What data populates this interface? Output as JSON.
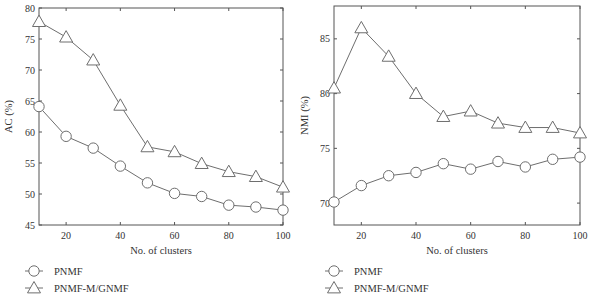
{
  "chart_data": [
    {
      "type": "line",
      "title": "",
      "xlabel": "No. of clusters",
      "ylabel": "AC (%)",
      "x": [
        10,
        20,
        30,
        40,
        50,
        60,
        70,
        80,
        90,
        100
      ],
      "xlim": [
        10,
        100
      ],
      "ylim": [
        45,
        80
      ],
      "xticks": [
        20,
        40,
        60,
        80,
        100
      ],
      "yticks": [
        45,
        50,
        55,
        60,
        65,
        70,
        75,
        80
      ],
      "grid": false,
      "legend_position": "below-left",
      "series": [
        {
          "name": "PNMF",
          "marker": "circle",
          "values": [
            64.1,
            59.3,
            57.4,
            54.5,
            51.8,
            50.1,
            49.6,
            48.2,
            47.9,
            47.4
          ]
        },
        {
          "name": "PNMF-M/GNMF",
          "marker": "triangle",
          "values": [
            77.8,
            75.3,
            71.6,
            64.3,
            57.6,
            56.8,
            54.9,
            53.6,
            52.8,
            51.1
          ]
        }
      ]
    },
    {
      "type": "line",
      "title": "",
      "xlabel": "No. of clusters",
      "ylabel": "NMI (%)",
      "x": [
        10,
        20,
        30,
        40,
        50,
        60,
        70,
        80,
        90,
        100
      ],
      "xlim": [
        10,
        100
      ],
      "ylim": [
        68,
        88
      ],
      "xticks": [
        20,
        40,
        60,
        80,
        100
      ],
      "yticks": [
        70,
        75,
        80,
        85
      ],
      "grid": false,
      "legend_position": "below-left",
      "series": [
        {
          "name": "PNMF",
          "marker": "circle",
          "values": [
            70.1,
            71.6,
            72.5,
            72.8,
            73.6,
            73.1,
            73.8,
            73.3,
            74.0,
            74.2
          ]
        },
        {
          "name": "PNMF-M/GNMF",
          "marker": "triangle",
          "values": [
            80.5,
            86.0,
            83.4,
            80.0,
            77.9,
            78.4,
            77.3,
            76.9,
            76.9,
            76.4
          ]
        }
      ]
    }
  ],
  "panels": [
    {
      "ylabel": "AC (%)",
      "xlabel": "No. of clusters",
      "legend": [
        "PNMF",
        "PNMF-M/GNMF"
      ]
    },
    {
      "ylabel": "NMI (%)",
      "xlabel": "No. of clusters",
      "legend": [
        "PNMF",
        "PNMF-M/GNMF"
      ]
    }
  ],
  "style": {
    "line_color": "#6e6e6e",
    "axis_color": "#555555",
    "text_color": "#333333"
  }
}
